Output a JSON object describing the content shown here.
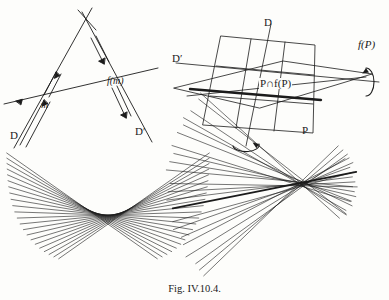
{
  "figure": {
    "caption": "Fig. IV.10.4.",
    "ink_color": "#1b1b1b",
    "paper_color": "#fdfdfb"
  },
  "panel_top_left": {
    "name": "two-lines-and-image-line",
    "labels": {
      "m": "m",
      "fm": "f(m)",
      "D": "D",
      "Dprime": "D′"
    }
  },
  "panel_top_right": {
    "name": "plane-intersection-3d",
    "labels": {
      "D": "D",
      "Dprime": "D′",
      "fP": "f(P)",
      "P": "P",
      "intersection": "P∩f(P)"
    }
  },
  "panel_bottom_left": {
    "name": "parabola-envelope-of-lines",
    "line_count": 22
  },
  "panel_bottom_right": {
    "name": "pencil-of-lines-degenerate-envelope",
    "line_count": 22
  },
  "chart_data": {
    "type": "line",
    "title": "Fig. IV.10.4.",
    "xlabel": "",
    "ylabel": "",
    "panels": [
      {
        "id": "top-left",
        "type": "line",
        "description": "Two lines D and D' meeting at an apex, crossed by a transversal line; m is the intersection with D, f(m) the intersection with D'.",
        "segments": [
          {
            "name": "line-D",
            "x1": 18,
            "y1": 142,
            "x2": 86,
            "y2": 18
          },
          {
            "name": "line-Dprime",
            "x1": 88,
            "y1": 14,
            "x2": 148,
            "y2": 136
          },
          {
            "name": "transversal",
            "x1": 6,
            "y1": 102,
            "x2": 152,
            "y2": 70
          }
        ],
        "points": [
          {
            "name": "m",
            "x": 45,
            "y": 96
          },
          {
            "name": "f(m)",
            "x": 106,
            "y": 83
          }
        ]
      },
      {
        "id": "top-right",
        "type": "line",
        "description": "A parallelogram plane P with grid lines, a second plane f(P) rotated about an axis, their intersection line P∩f(P) drawn bold, with rotation arrows about D and about the horizontal axis.",
        "planes": [
          "P",
          "f(P)"
        ],
        "axes": [
          "D",
          "D′"
        ]
      },
      {
        "id": "bottom-left",
        "type": "line",
        "description": "Envelope of a family of 22 straight lines tangent to a downward-opening parabola.",
        "curve": "parabola",
        "orientation": "opens-down",
        "vertex": [
          108,
          215
        ],
        "line_count": 22
      },
      {
        "id": "bottom-right",
        "type": "line",
        "description": "Degenerate envelope: a pencil of 22 straight lines all passing through (nearly) one point.",
        "curve": "point",
        "focus": [
          303,
          184
        ],
        "line_count": 22
      }
    ]
  }
}
